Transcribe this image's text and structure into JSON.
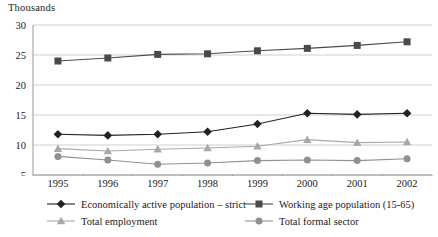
{
  "chart_data": {
    "type": "line",
    "title": "",
    "ylabel": "Thousands",
    "xlabel": "",
    "categories": [
      "1995",
      "1996",
      "1997",
      "1998",
      "1999",
      "2000",
      "2001",
      "2002"
    ],
    "ylim": [
      5,
      30
    ],
    "yticks": [
      5,
      10,
      15,
      20,
      25,
      30
    ],
    "grid": true,
    "legend_position": "bottom",
    "series": [
      {
        "name": "Economically active population – strict",
        "marker": "diamond",
        "color": "#222222",
        "values": [
          11.8,
          11.6,
          11.8,
          12.2,
          13.5,
          15.3,
          15.1,
          15.3
        ]
      },
      {
        "name": "Working age population (15-65)",
        "marker": "square",
        "color": "#4a4a4a",
        "values": [
          24.0,
          24.5,
          25.1,
          25.2,
          25.7,
          26.1,
          26.6,
          27.2
        ]
      },
      {
        "name": "Total employment",
        "marker": "triangle",
        "color": "#a8a8a8",
        "values": [
          9.4,
          9.0,
          9.3,
          9.5,
          9.8,
          10.9,
          10.4,
          10.5
        ]
      },
      {
        "name": "Total formal sector",
        "marker": "circle",
        "color": "#909090",
        "values": [
          8.1,
          7.5,
          6.8,
          7.0,
          7.4,
          7.5,
          7.4,
          7.7
        ]
      }
    ]
  },
  "axis": {
    "y_title": "Thousands",
    "y_ticks": [
      "30",
      "25",
      "20",
      "15",
      "10",
      "5"
    ],
    "x_ticks": [
      "1995",
      "1996",
      "1997",
      "1998",
      "1999",
      "2000",
      "2001",
      "2002"
    ]
  },
  "legend": {
    "items": [
      {
        "label": "Economically active population – strict",
        "marker": "diamond",
        "color": "#222222"
      },
      {
        "label": "Working age population (15-65)",
        "marker": "square",
        "color": "#4a4a4a"
      },
      {
        "label": "Total employment",
        "marker": "triangle",
        "color": "#a8a8a8"
      },
      {
        "label": "Total formal sector",
        "marker": "circle",
        "color": "#909090"
      }
    ]
  },
  "style": {
    "grid_color": "#c9c9c9",
    "axis_color": "#8d8d8d",
    "background": "#ffffff"
  }
}
